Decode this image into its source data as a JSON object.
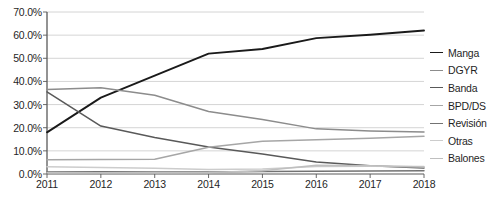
{
  "chart_data": {
    "type": "line",
    "title": "",
    "subtitle": "",
    "xlabel": "",
    "ylabel": "",
    "categories": [
      "2011",
      "2012",
      "2013",
      "2014",
      "2015",
      "2016",
      "2017",
      "2018"
    ],
    "x_tick_labels": [
      "2011",
      "2012",
      "2013",
      "2014",
      "2015",
      "2016",
      "2017",
      "2018"
    ],
    "y_tick_labels": [
      "0.0%",
      "10.0%",
      "20.0%",
      "30.0%",
      "40.0%",
      "50.0%",
      "60.0%",
      "70.0%"
    ],
    "y_tick_values": [
      0,
      10,
      20,
      30,
      40,
      50,
      60,
      70
    ],
    "ylim": [
      0,
      70
    ],
    "grid": true,
    "grid_axis": "y",
    "legend_position": "right",
    "value_suffix": "%",
    "series": [
      {
        "name": "Manga",
        "color": "#1a1a1a",
        "width": 1.9,
        "values": [
          18.0,
          33.0,
          42.5,
          52.0,
          54.0,
          58.7,
          60.2,
          62.0
        ]
      },
      {
        "name": "DGYR",
        "color": "#8c8c8c",
        "width": 1.5,
        "values": [
          36.5,
          37.3,
          34.0,
          27.0,
          23.5,
          19.5,
          18.6,
          18.2
        ]
      },
      {
        "name": "Banda",
        "color": "#595959",
        "width": 1.5,
        "values": [
          35.5,
          20.7,
          15.8,
          11.7,
          8.6,
          5.2,
          3.6,
          2.6
        ]
      },
      {
        "name": "BPD/DS",
        "color": "#a6a6a6",
        "width": 1.5,
        "values": [
          6.2,
          6.3,
          6.4,
          11.6,
          14.2,
          14.8,
          15.5,
          16.3
        ]
      },
      {
        "name": "Revisión",
        "color": "#737373",
        "width": 1.5,
        "values": [
          0.9,
          1.0,
          0.9,
          0.9,
          1.1,
          1.2,
          1.3,
          1.4
        ]
      },
      {
        "name": "Otras",
        "color": "#cccccc",
        "width": 1.5,
        "values": [
          3.1,
          2.8,
          2.5,
          1.9,
          2.2,
          3.2,
          3.3,
          3.2
        ]
      },
      {
        "name": "Balones",
        "color": "#bfbfbf",
        "width": 1.5,
        "values": [
          0.5,
          0.5,
          0.5,
          0.6,
          1.4,
          3.8,
          3.6,
          3.0
        ]
      }
    ]
  },
  "axis": {
    "axis_line_color": "#595959",
    "grid_line_color": "#c9c9c9"
  }
}
